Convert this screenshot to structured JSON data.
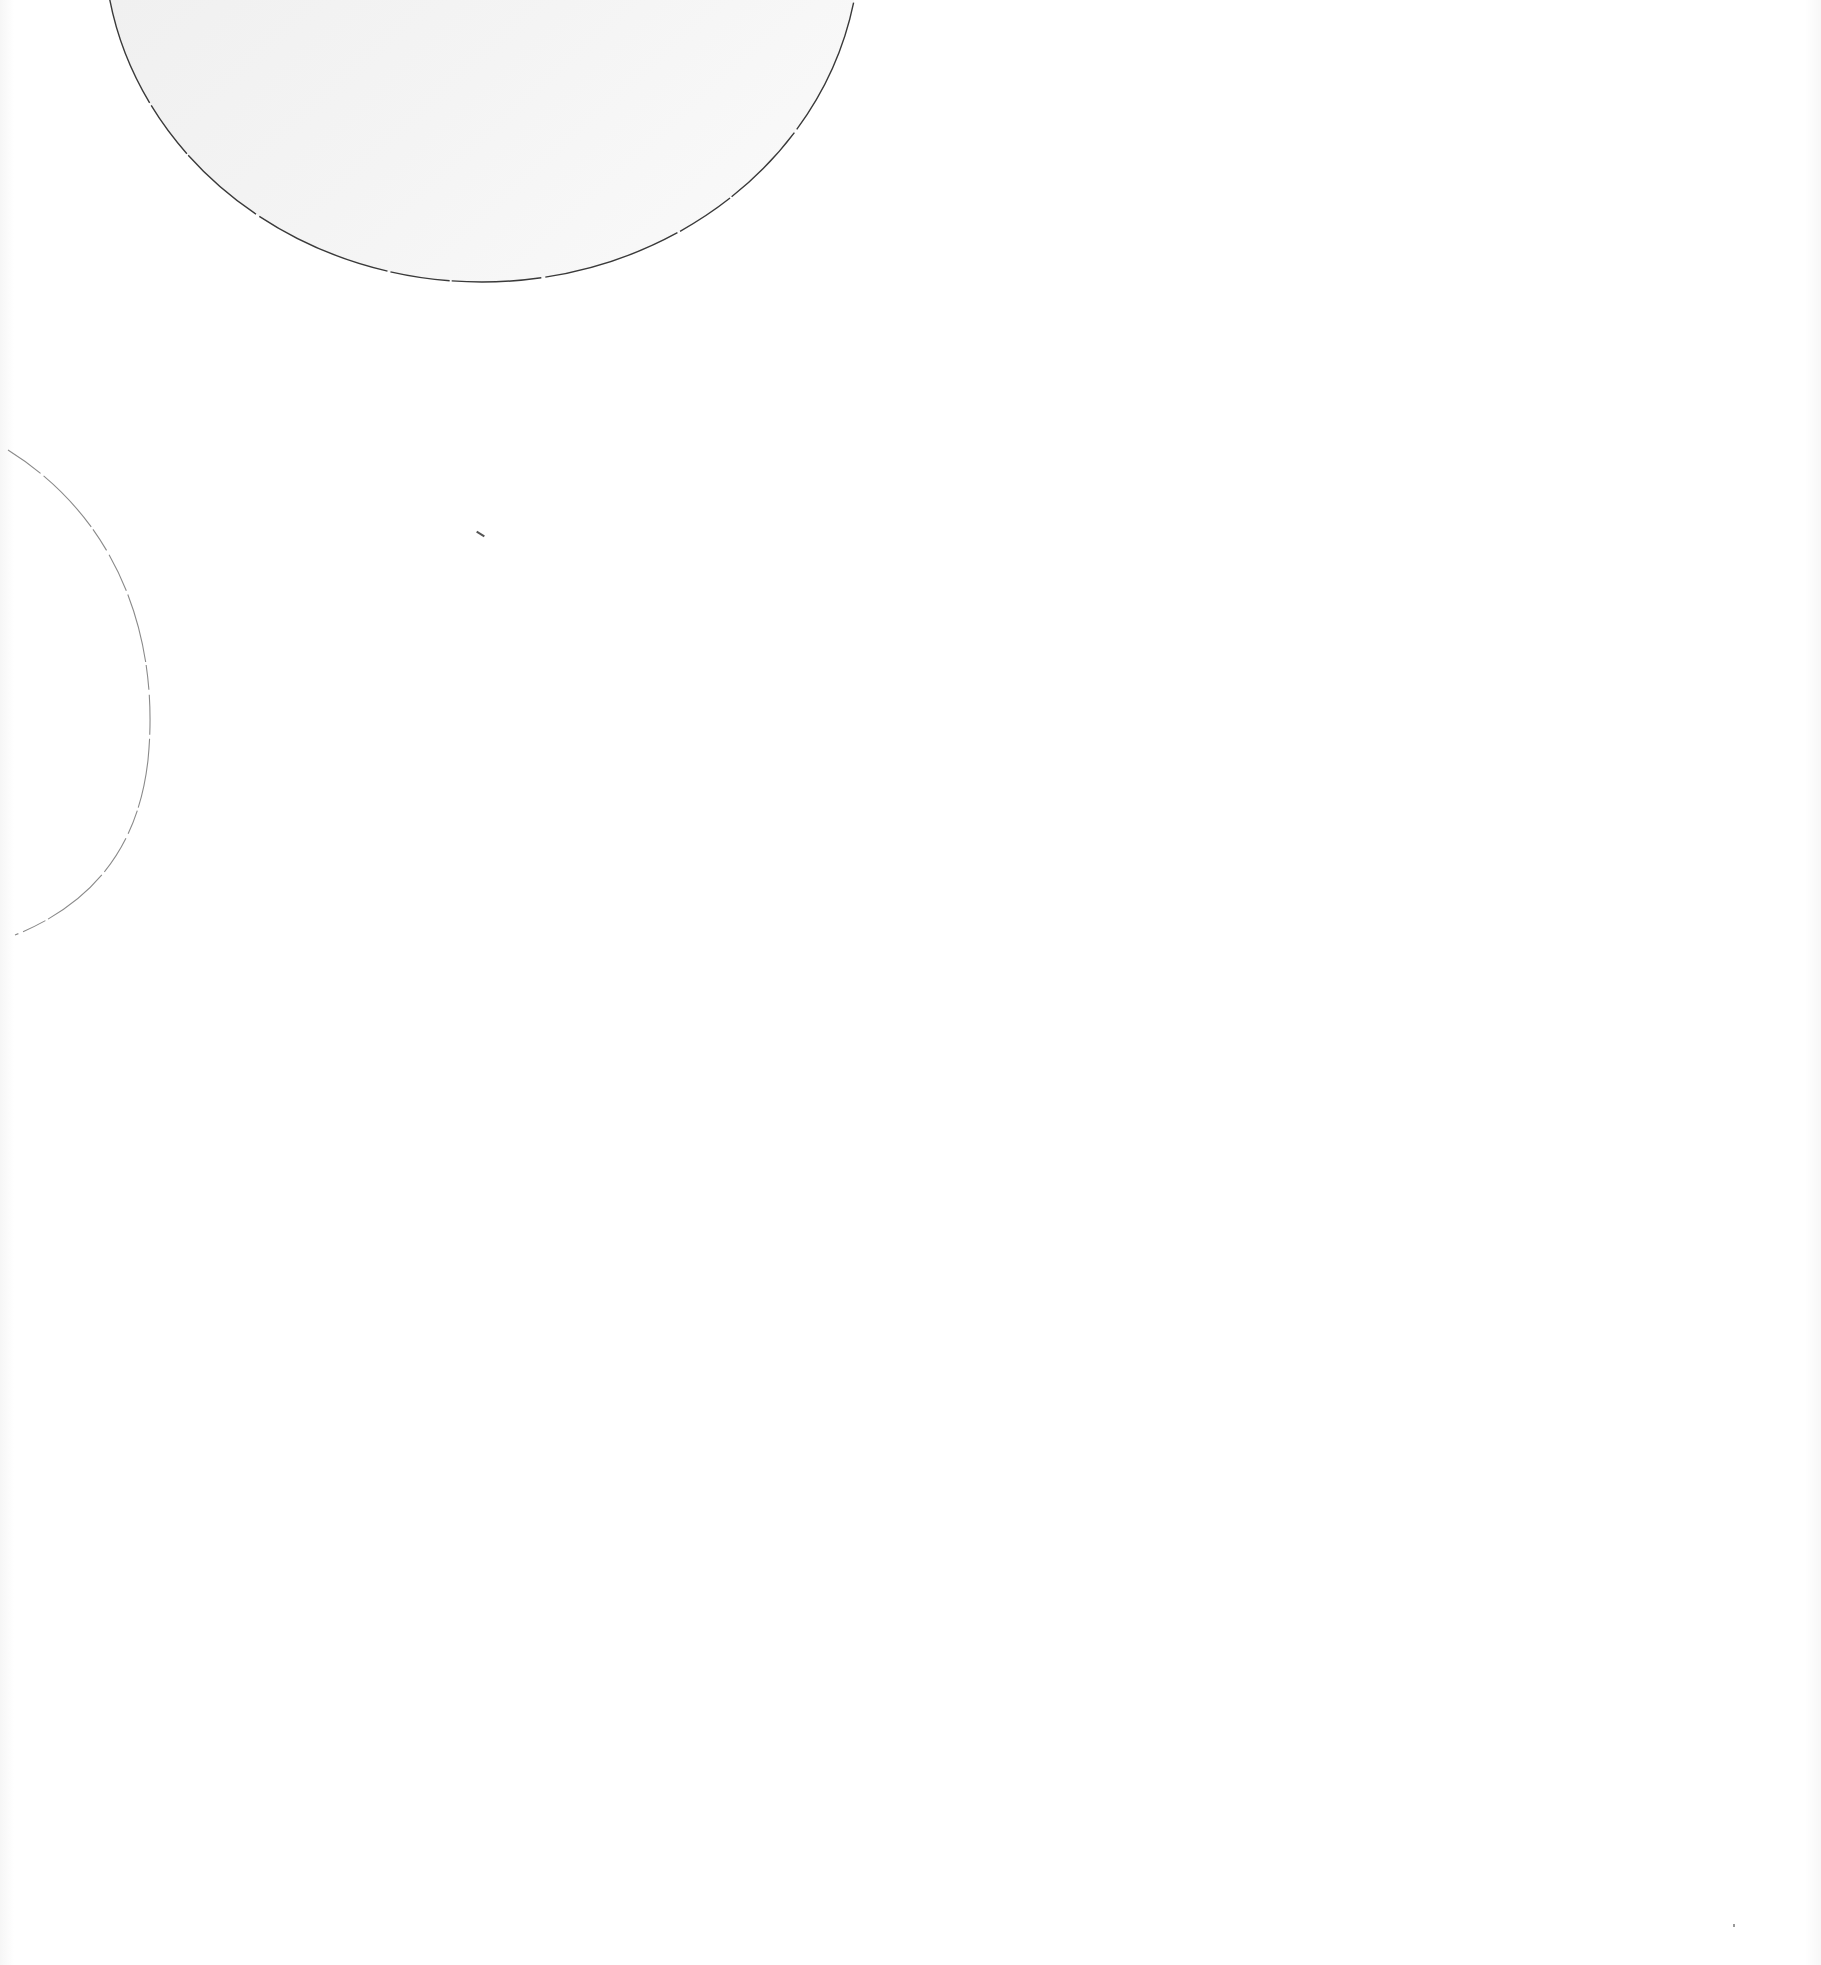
{
  "page": {
    "background_color": "#ffffff"
  },
  "shapes": {
    "top_semicircle": {
      "fill": "#efefef",
      "stroke": "#3a3a3a",
      "cx": 482,
      "cy": -60,
      "rx": 378,
      "ry": 342
    },
    "left_arc": {
      "stroke": "#8a8a8a",
      "cx": -40,
      "cy": 705,
      "r": 190
    }
  },
  "marks": [
    {
      "x": 478,
      "y": 535
    },
    {
      "x": 1733,
      "y": 1925
    }
  ]
}
